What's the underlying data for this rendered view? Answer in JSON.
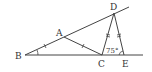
{
  "diagram": {
    "points": {
      "A": {
        "label": "A",
        "x": 64,
        "y": 37
      },
      "B": {
        "label": "B",
        "x": 25,
        "y": 55
      },
      "C": {
        "label": "C",
        "x": 102,
        "y": 55
      },
      "D": {
        "label": "D",
        "x": 114,
        "y": 13
      },
      "E": {
        "label": "E",
        "x": 124,
        "y": 55
      }
    },
    "angle_label": "75°",
    "colors": {
      "line": "#444444",
      "text": "#333333"
    }
  }
}
